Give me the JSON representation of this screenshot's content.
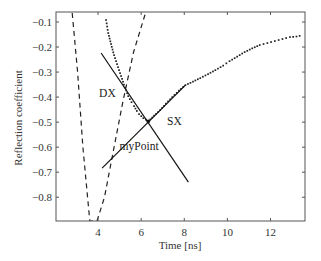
{
  "chart_data": {
    "type": "line",
    "title": "",
    "xlabel": "Time [ns]",
    "ylabel": "Reflection coefficient",
    "xlim": [
      2.05,
      13.6
    ],
    "ylim": [
      -0.895,
      -0.06
    ],
    "grid": false,
    "legend": null,
    "xticks": [
      4,
      6,
      8,
      10,
      12
    ],
    "xtick_labels": [
      "4",
      "6",
      "8",
      "10",
      "12"
    ],
    "yticks": [
      -0.1,
      -0.2,
      -0.3,
      -0.4,
      -0.5,
      -0.6,
      -0.7,
      -0.8
    ],
    "ytick_labels": [
      "-0.1",
      "-0.2",
      "-0.3",
      "-0.4",
      "-0.5",
      "-0.6",
      "-0.7",
      "-0.8"
    ],
    "series": [
      {
        "name": "measured",
        "style": "dotted-markers",
        "color": "#222222",
        "x": [
          4.37,
          4.47,
          4.6,
          4.74,
          4.88,
          5.02,
          5.2,
          5.4,
          5.55,
          5.67,
          5.8,
          5.9,
          6.1,
          6.33,
          6.6,
          6.88,
          7.15,
          7.44,
          7.75,
          8.05,
          8.4,
          8.74,
          9.1,
          9.44,
          9.8,
          10.1,
          10.45,
          10.8,
          11.15,
          11.5,
          11.85,
          12.2,
          12.55,
          12.9,
          13.2,
          13.5
        ],
        "y": [
          -0.092,
          -0.144,
          -0.188,
          -0.232,
          -0.268,
          -0.304,
          -0.35,
          -0.396,
          -0.42,
          -0.436,
          -0.455,
          -0.468,
          -0.484,
          -0.496,
          -0.474,
          -0.452,
          -0.426,
          -0.4,
          -0.374,
          -0.352,
          -0.338,
          -0.324,
          -0.308,
          -0.292,
          -0.274,
          -0.256,
          -0.238,
          -0.22,
          -0.205,
          -0.192,
          -0.184,
          -0.176,
          -0.168,
          -0.16,
          -0.158,
          -0.152
        ]
      },
      {
        "name": "dashed-curve",
        "style": "dashed",
        "color": "#222222",
        "x": [
          2.8,
          3.05,
          3.3,
          3.62,
          3.95,
          4.3,
          4.7,
          5.15,
          5.65,
          6.2
        ],
        "y": [
          -0.064,
          -0.3,
          -0.6,
          -0.895,
          -0.895,
          -0.8,
          -0.62,
          -0.42,
          -0.22,
          -0.064
        ]
      },
      {
        "name": "DX",
        "style": "solid",
        "color": "#111111",
        "x": [
          4.14,
          8.19
        ],
        "y": [
          -0.224,
          -0.74
        ]
      },
      {
        "name": "SX",
        "style": "solid",
        "color": "#111111",
        "x": [
          4.19,
          8.05
        ],
        "y": [
          -0.684,
          -0.352
        ]
      }
    ],
    "annotations": [
      {
        "text": "DX",
        "x": 4.05,
        "y": -0.4
      },
      {
        "text": "SX",
        "x": 7.2,
        "y": -0.51
      },
      {
        "text": "myPoint",
        "x": 5.0,
        "y": -0.61
      }
    ],
    "highlight_point": {
      "label": "myPoint",
      "x": 6.33,
      "y": -0.497
    }
  }
}
